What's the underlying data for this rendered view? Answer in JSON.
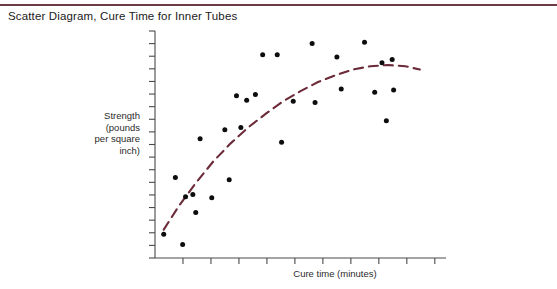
{
  "page": {
    "width": 557,
    "height": 289,
    "background": "#ffffff",
    "rule_color": "#6b3b44"
  },
  "title": "Scatter Diagram, Cure Time for Inner Tubes",
  "axes": {
    "y_label_lines": [
      "Strength",
      "(pounds",
      "per square",
      "inch)"
    ],
    "y_label_text": "Strength (pounds per square inch)",
    "x_label": "Cure time (minutes)",
    "axis_color": "#4a4a4a",
    "tick_color": "#4a4a4a",
    "y_tick_count": 19,
    "x_tick_count": 10,
    "origin": [
      155,
      258
    ],
    "x_end": 446,
    "y_top": 31
  },
  "chart_data": {
    "type": "scatter",
    "title": "Scatter Diagram, Cure Time for Inner Tubes",
    "xlabel": "Cure time (minutes)",
    "ylabel": "Strength (pounds per square inch)",
    "grid": false,
    "legend": false,
    "xlim": [
      0,
      10
    ],
    "ylim": [
      0,
      10
    ],
    "axis_ticks_labeled": false,
    "point_color": "#0d0d0d",
    "trend": {
      "style": "dashed",
      "color": "#6b2b39",
      "shape": "concave-increasing-saturating",
      "x": [
        0.3,
        0.8,
        1.4,
        2.0,
        2.6,
        3.2,
        3.8,
        4.4,
        5.0,
        5.6,
        6.2,
        6.8,
        7.4,
        8.0,
        8.6,
        9.1
      ],
      "y": [
        1.25,
        2.25,
        3.3,
        4.25,
        5.05,
        5.75,
        6.35,
        6.9,
        7.35,
        7.75,
        8.05,
        8.3,
        8.45,
        8.5,
        8.45,
        8.3
      ]
    },
    "points": [
      {
        "x": 0.3,
        "y": 1.05
      },
      {
        "x": 0.95,
        "y": 0.6
      },
      {
        "x": 0.7,
        "y": 3.55
      },
      {
        "x": 1.05,
        "y": 2.7
      },
      {
        "x": 1.3,
        "y": 2.8
      },
      {
        "x": 1.4,
        "y": 2.0
      },
      {
        "x": 1.55,
        "y": 5.25
      },
      {
        "x": 1.95,
        "y": 2.65
      },
      {
        "x": 2.4,
        "y": 5.65
      },
      {
        "x": 2.55,
        "y": 3.45
      },
      {
        "x": 2.8,
        "y": 7.15
      },
      {
        "x": 2.95,
        "y": 5.75
      },
      {
        "x": 3.15,
        "y": 6.95
      },
      {
        "x": 3.45,
        "y": 7.2
      },
      {
        "x": 3.7,
        "y": 8.95
      },
      {
        "x": 4.2,
        "y": 8.95
      },
      {
        "x": 4.35,
        "y": 5.1
      },
      {
        "x": 4.75,
        "y": 6.9
      },
      {
        "x": 5.4,
        "y": 9.45
      },
      {
        "x": 5.5,
        "y": 6.85
      },
      {
        "x": 6.25,
        "y": 8.85
      },
      {
        "x": 6.4,
        "y": 7.45
      },
      {
        "x": 7.2,
        "y": 9.5
      },
      {
        "x": 7.55,
        "y": 7.3
      },
      {
        "x": 7.8,
        "y": 8.6
      },
      {
        "x": 8.15,
        "y": 8.75
      },
      {
        "x": 8.2,
        "y": 7.4
      },
      {
        "x": 7.95,
        "y": 6.05
      }
    ]
  }
}
